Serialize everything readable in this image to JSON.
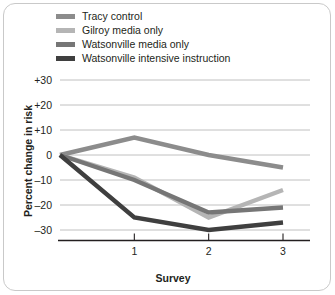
{
  "chart_data": {
    "type": "line",
    "title": "",
    "xlabel": "Survey",
    "ylabel": "Percent change in risk",
    "x": [
      0,
      1,
      2,
      3
    ],
    "xtick_values": [
      1,
      2,
      3
    ],
    "xtick_labels": [
      "1",
      "2",
      "3"
    ],
    "xlim": [
      0,
      3
    ],
    "ylim": [
      -35,
      32
    ],
    "ytick_values": [
      30,
      20,
      10,
      0,
      -10,
      -20,
      -30
    ],
    "ytick_labels": [
      "+30",
      "+20",
      "+10",
      "0",
      "–10",
      "–20",
      "–30"
    ],
    "grid": true,
    "legend_position": "top-left",
    "series": [
      {
        "name": "Tracy control",
        "color": "#8c8c8c",
        "values": [
          0,
          7,
          0,
          -5
        ]
      },
      {
        "name": "Gilroy media only",
        "color": "#b5b5b5",
        "values": [
          0,
          -9,
          -25,
          -14
        ]
      },
      {
        "name": "Watsonville media only",
        "color": "#767676",
        "values": [
          0,
          -10,
          -23,
          -21
        ]
      },
      {
        "name": "Watsonville intensive instruction",
        "color": "#3f3f3f",
        "values": [
          0,
          -25,
          -30,
          -27
        ]
      }
    ],
    "axis_color": "#231f20",
    "grid_color": "#b9b9b9",
    "frame_color": "#c9c9c9",
    "background_color": "#ffffff"
  }
}
